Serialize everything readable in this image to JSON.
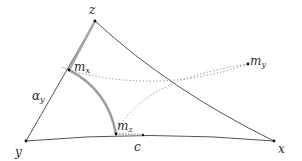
{
  "diagram": {
    "type": "hyperbolic-triangle",
    "colors": {
      "edge": "#555555",
      "highlight": "#a8a8a8",
      "dotted": "#777777",
      "point": "#111111",
      "label": "#2a2a2a"
    },
    "vertices": {
      "z": {
        "label": "z",
        "x": 95,
        "y": 21
      },
      "y": {
        "label": "y",
        "x": 26,
        "y": 141
      },
      "x": {
        "label": "x",
        "x": 274,
        "y": 141
      }
    },
    "midpoints": {
      "m_x": {
        "base": "m",
        "sub": "x",
        "x": 69,
        "y": 70
      },
      "m_y": {
        "base": "m",
        "sub": "y",
        "x": 248,
        "y": 64
      },
      "m_z": {
        "base": "m",
        "sub": "z",
        "x": 116,
        "y": 134
      }
    },
    "point_c": {
      "label": "c",
      "x": 143,
      "y": 135
    },
    "angle_label": {
      "base": "α",
      "sub": "y"
    }
  }
}
